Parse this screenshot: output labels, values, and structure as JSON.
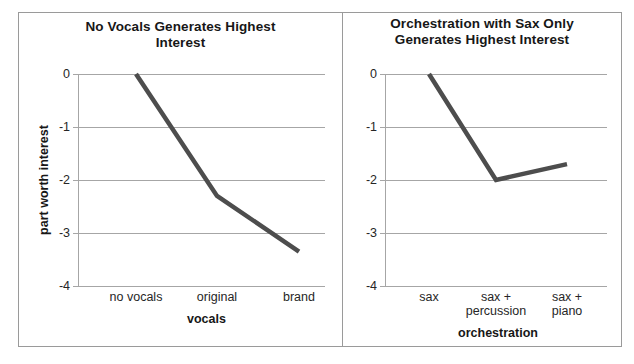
{
  "figure": {
    "panel_count": 2
  },
  "chart_data": [
    {
      "type": "line",
      "title": "No Vocals Generates Highest Interest",
      "xlabel": "vocals",
      "ylabel": "part worth interest",
      "categories": [
        "no vocals",
        "original",
        "brand"
      ],
      "values": [
        0,
        -2.3,
        -3.35
      ],
      "ylim": [
        -4,
        0
      ],
      "yticks": [
        0,
        -1,
        -2,
        -3,
        -4
      ],
      "ytick_labels": [
        "0",
        "-1",
        "-2",
        "-3",
        "-4"
      ],
      "grid": true,
      "legend": "none",
      "line_color": "#4d4d4d",
      "line_width": 4
    },
    {
      "type": "line",
      "title": "Orchestration with Sax Only Generates Highest Interest",
      "xlabel": "orchestration",
      "ylabel": "",
      "categories": [
        "sax",
        "sax +\npercussion",
        "sax + piano"
      ],
      "values": [
        0,
        -2.0,
        -1.7
      ],
      "ylim": [
        -4,
        0
      ],
      "yticks": [
        0,
        -1,
        -2,
        -3,
        -4
      ],
      "ytick_labels": [
        "0",
        "-1",
        "-2",
        "-3",
        "-4"
      ],
      "grid": true,
      "legend": "none",
      "line_color": "#4d4d4d",
      "line_width": 4
    }
  ],
  "panels": [
    {
      "title_line1": "No Vocals Generates Highest",
      "title_line2": "Interest",
      "yaxis_title": "part worth interest",
      "xaxis_title": "vocals",
      "ytick_0": "0",
      "ytick_1": "-1",
      "ytick_2": "-2",
      "ytick_3": "-3",
      "ytick_4": "-4",
      "xtick_0": "no vocals",
      "xtick_1": "original",
      "xtick_2": "brand"
    },
    {
      "title_line1": "Orchestration with Sax Only",
      "title_line2": "Generates Highest Interest",
      "yaxis_title": "",
      "xaxis_title": "orchestration",
      "ytick_0": "0",
      "ytick_1": "-1",
      "ytick_2": "-2",
      "ytick_3": "-3",
      "ytick_4": "-4",
      "xtick_0": "sax",
      "xtick_1": "sax +\npercussion",
      "xtick_2": "sax + piano"
    }
  ]
}
